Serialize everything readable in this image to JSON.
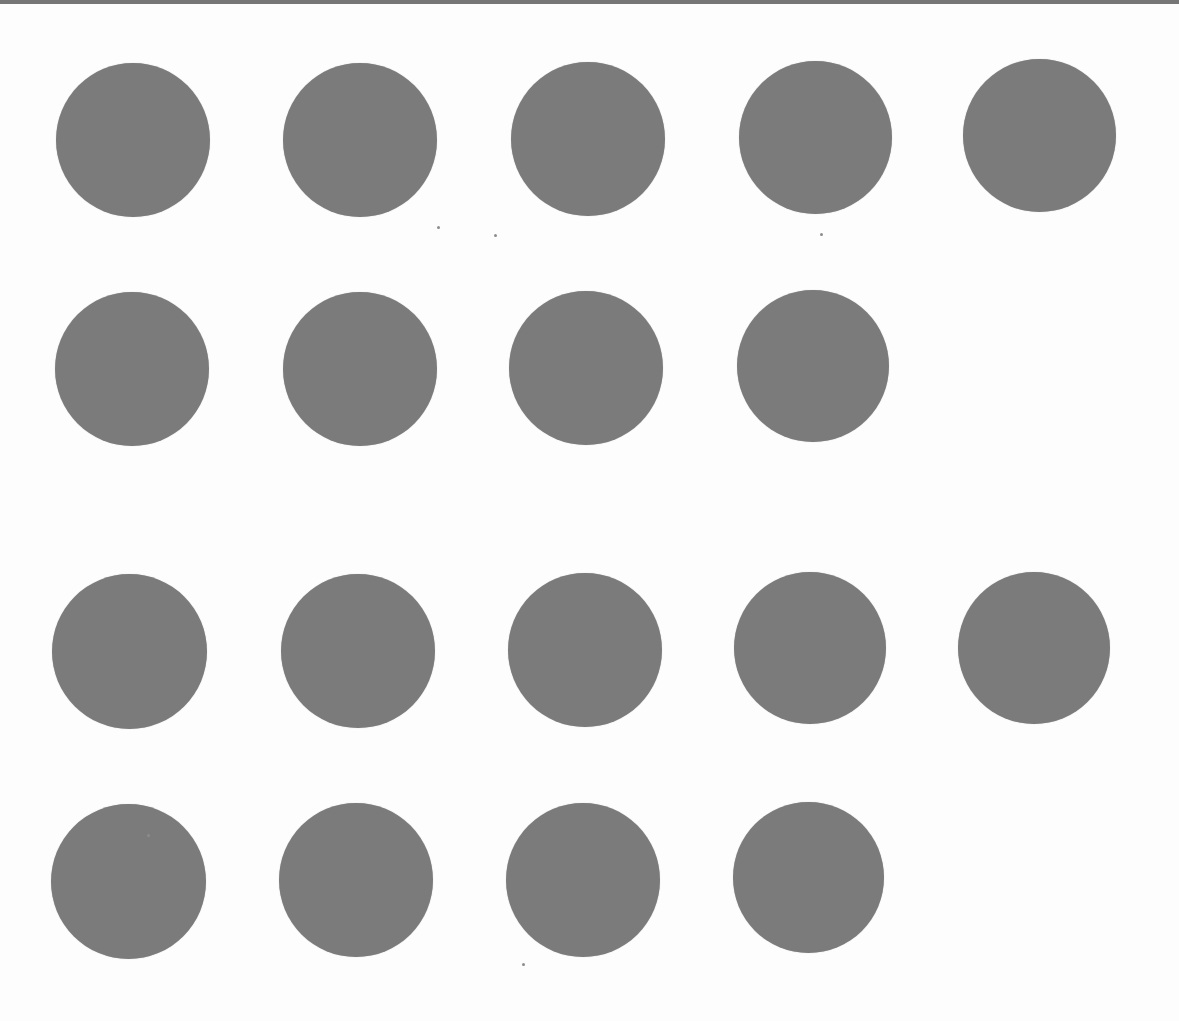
{
  "sheet": {
    "background": "#fdfdfd",
    "top_edge_color": "#767676",
    "dot_color": "#7b7b7b",
    "dot_count": 18,
    "rows": [
      {
        "index": 1,
        "count": 5,
        "dots": [
          {
            "x": 56,
            "y": 63,
            "d": 154
          },
          {
            "x": 283,
            "y": 63,
            "d": 154
          },
          {
            "x": 511,
            "y": 62,
            "d": 154
          },
          {
            "x": 739,
            "y": 61,
            "d": 153
          },
          {
            "x": 963,
            "y": 59,
            "d": 153
          }
        ]
      },
      {
        "index": 2,
        "count": 4,
        "dots": [
          {
            "x": 55,
            "y": 292,
            "d": 154
          },
          {
            "x": 283,
            "y": 292,
            "d": 154
          },
          {
            "x": 509,
            "y": 291,
            "d": 154
          },
          {
            "x": 737,
            "y": 290,
            "d": 152
          }
        ]
      },
      {
        "index": 3,
        "count": 5,
        "dots": [
          {
            "x": 52,
            "y": 574,
            "d": 155
          },
          {
            "x": 281,
            "y": 574,
            "d": 154
          },
          {
            "x": 508,
            "y": 573,
            "d": 154
          },
          {
            "x": 734,
            "y": 572,
            "d": 152
          },
          {
            "x": 958,
            "y": 572,
            "d": 152
          }
        ]
      },
      {
        "index": 4,
        "count": 4,
        "dots": [
          {
            "x": 51,
            "y": 804,
            "d": 155
          },
          {
            "x": 279,
            "y": 803,
            "d": 154
          },
          {
            "x": 506,
            "y": 803,
            "d": 154
          },
          {
            "x": 733,
            "y": 802,
            "d": 151
          }
        ]
      }
    ],
    "specks": [
      {
        "x": 437,
        "y": 226
      },
      {
        "x": 494,
        "y": 234
      },
      {
        "x": 820,
        "y": 233
      },
      {
        "x": 147,
        "y": 834
      },
      {
        "x": 522,
        "y": 963
      }
    ]
  }
}
